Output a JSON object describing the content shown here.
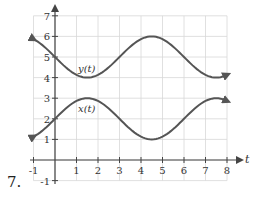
{
  "problem": {
    "number": "7."
  },
  "chart_data": {
    "type": "line",
    "title": "",
    "xlabel": "t",
    "ylabel": "",
    "xlim": [
      -1,
      8
    ],
    "ylim": [
      -1,
      7
    ],
    "grid": true,
    "x_ticks": [
      "-1",
      "1",
      "2",
      "3",
      "4",
      "5",
      "6",
      "7",
      "8"
    ],
    "y_ticks": [
      "7",
      "6",
      "5",
      "4",
      "3",
      "2",
      "1",
      "-1"
    ],
    "series": [
      {
        "name": "y(t)",
        "label": "y(t)",
        "x": [
          -1,
          0,
          1.5,
          3,
          4.5,
          6,
          7.5,
          8
        ],
        "values": [
          6,
          5,
          4,
          5,
          6,
          5,
          4,
          4.2
        ],
        "description": "sinusoid, max 6 at t≈4.5, min 4 at t≈1.5 and t≈7.5"
      },
      {
        "name": "x(t)",
        "label": "x(t)",
        "x": [
          -1,
          0,
          1.5,
          3,
          4.5,
          6,
          7.5,
          8
        ],
        "values": [
          1,
          2,
          3,
          2,
          1,
          2,
          3,
          2.8
        ],
        "description": "sinusoid, max 3 at t≈1.5 and t≈7.5, min 1 at t≈4.5"
      }
    ],
    "colors": {
      "curve": "#555555",
      "grid": "#d8d8d8",
      "axis": "#444444"
    }
  }
}
